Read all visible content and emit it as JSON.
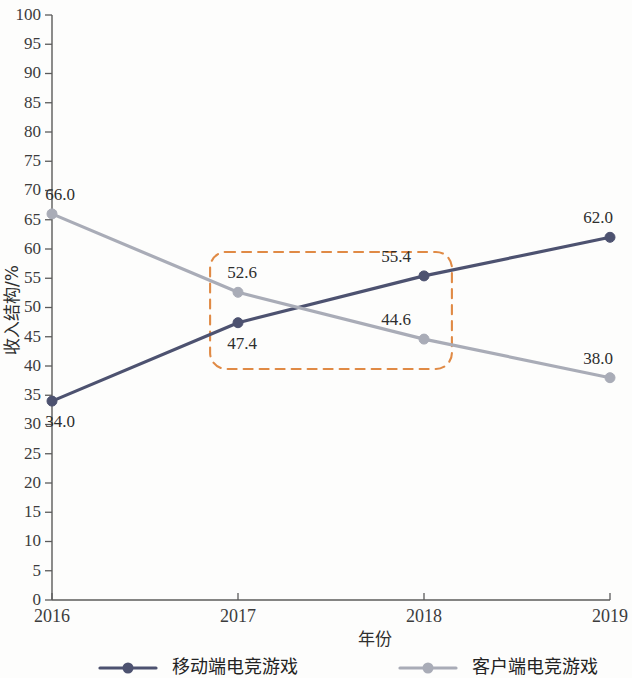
{
  "chart_data": {
    "type": "line",
    "title": "",
    "xlabel": "年份",
    "ylabel": "收入结构/%",
    "categories": [
      "2016",
      "2017",
      "2018",
      "2019"
    ],
    "x": [
      2016,
      2017,
      2018,
      2019
    ],
    "xlim": [
      2016,
      2019
    ],
    "ylim": [
      0,
      100
    ],
    "ytick_step": 5,
    "yticks": [
      "0",
      "5",
      "10",
      "15",
      "20",
      "25",
      "30",
      "35",
      "40",
      "45",
      "50",
      "55",
      "60",
      "65",
      "70",
      "75",
      "80",
      "85",
      "90",
      "95",
      "100"
    ],
    "grid": false,
    "legend_position": "bottom",
    "series": [
      {
        "name": "移动端电竞游戏",
        "color": "#4d5270",
        "values": [
          34.0,
          47.4,
          55.4,
          62.0
        ],
        "labels": [
          "34.0",
          "47.4",
          "55.4",
          "62.0"
        ],
        "label_positions": [
          "below",
          "below",
          "above",
          "above"
        ]
      },
      {
        "name": "客户端电竞游戏",
        "color": "#a9acb7",
        "values": [
          66.0,
          52.6,
          44.6,
          38.0
        ],
        "labels": [
          "66.0",
          "52.6",
          "44.6",
          "38.0"
        ],
        "label_positions": [
          "above",
          "above",
          "above",
          "above"
        ]
      }
    ],
    "annotations": [
      {
        "type": "rounded-dashed-rect",
        "color": "#e08a45",
        "x_start": 2016.85,
        "x_end": 2018.15,
        "y_bottom": 39.5,
        "y_top": 59.5
      }
    ]
  }
}
